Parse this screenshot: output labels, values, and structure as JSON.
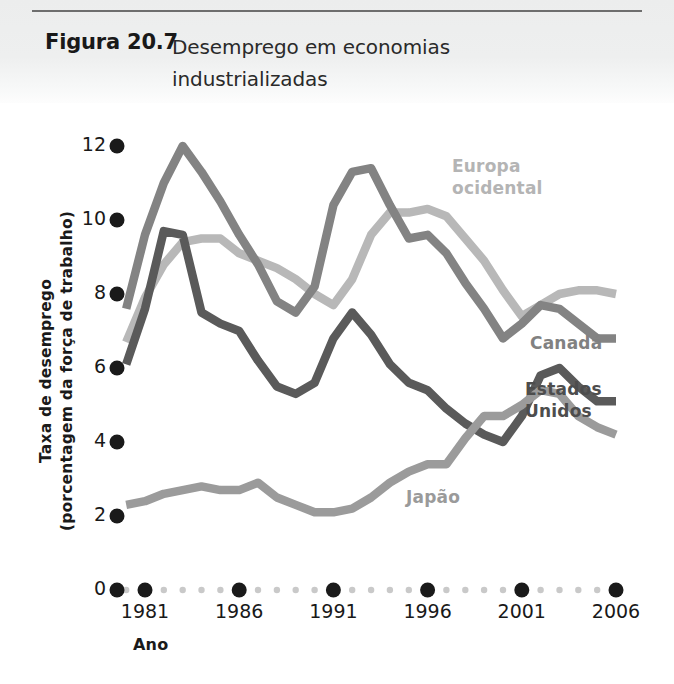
{
  "figure": {
    "label": "Figura 20.7",
    "title": "Desemprego em economias industrializadas"
  },
  "colors": {
    "europa_ocidental": "#b8b8b8",
    "canada": "#838383",
    "estados_unidos": "#5a5a5a",
    "japao": "#9b9b9b",
    "axis_dot": "#1a1a1a",
    "minor_dot": "#c9c9c9",
    "header_band": "#ececed"
  },
  "chart_data": {
    "type": "line",
    "title": "Desemprego em economias industrializadas",
    "xlabel": "Ano",
    "ylabel": "Taxa de desemprego (porcentagem da força de trabalho)",
    "xlim": [
      1980,
      2006
    ],
    "ylim": [
      0,
      12
    ],
    "xticks": [
      1981,
      1986,
      1991,
      1996,
      2001,
      2006
    ],
    "yticks": [
      0,
      2,
      4,
      6,
      8,
      10,
      12
    ],
    "grid": false,
    "legend": "inline-labels",
    "x": [
      1980,
      1981,
      1982,
      1983,
      1984,
      1985,
      1986,
      1987,
      1988,
      1989,
      1990,
      1991,
      1992,
      1993,
      1994,
      1995,
      1996,
      1997,
      1998,
      1999,
      2000,
      2001,
      2002,
      2003,
      2004,
      2005,
      2006
    ],
    "series": [
      {
        "name": "Europa ocidental",
        "color": "#b8b8b8",
        "label_text": "Europa\nocidental",
        "values": [
          6.7,
          7.9,
          8.8,
          9.4,
          9.5,
          9.5,
          9.1,
          8.9,
          8.7,
          8.4,
          8.0,
          7.7,
          8.4,
          9.6,
          10.2,
          10.2,
          10.3,
          10.1,
          9.5,
          8.9,
          8.1,
          7.4,
          7.7,
          8.0,
          8.1,
          8.1,
          8.0
        ],
        "endpoint_value": 8.0
      },
      {
        "name": "Canadá",
        "color": "#838383",
        "label_text": "Canadá",
        "values": [
          7.6,
          9.6,
          11.0,
          12.0,
          11.3,
          10.5,
          9.6,
          8.8,
          7.8,
          7.5,
          8.2,
          10.4,
          11.3,
          11.4,
          10.4,
          9.5,
          9.6,
          9.1,
          8.3,
          7.6,
          6.8,
          7.2,
          7.7,
          7.6,
          7.2,
          6.8,
          6.8
        ],
        "endpoint_value": 6.8
      },
      {
        "name": "Estados Unidos",
        "color": "#5a5a5a",
        "label_text": "Estados\nUnidos",
        "values": [
          6.1,
          7.6,
          9.7,
          9.6,
          7.5,
          7.2,
          7.0,
          6.2,
          5.5,
          5.3,
          5.6,
          6.8,
          7.5,
          6.9,
          6.1,
          5.6,
          5.4,
          4.9,
          4.5,
          4.2,
          4.0,
          4.7,
          5.8,
          6.0,
          5.5,
          5.1,
          5.1
        ],
        "endpoint_value": 5.1
      },
      {
        "name": "Japão",
        "color": "#9b9b9b",
        "label_text": "Japão",
        "values": [
          2.3,
          2.4,
          2.6,
          2.7,
          2.8,
          2.7,
          2.7,
          2.9,
          2.5,
          2.3,
          2.1,
          2.1,
          2.2,
          2.5,
          2.9,
          3.2,
          3.4,
          3.4,
          4.1,
          4.7,
          4.7,
          5.0,
          5.4,
          5.3,
          4.7,
          4.4,
          4.2
        ],
        "endpoint_value": 4.2
      }
    ]
  },
  "axes": {
    "x_title": "Ano",
    "y_title_line1": "Taxa de desemprego",
    "y_title_line2": "(porcentagem da força de trabalho)",
    "y_tick_labels": [
      "12",
      "10",
      "8",
      "6",
      "4",
      "2",
      "0"
    ],
    "x_tick_labels": [
      "1981",
      "1986",
      "1991",
      "1996",
      "2001",
      "2006"
    ]
  }
}
